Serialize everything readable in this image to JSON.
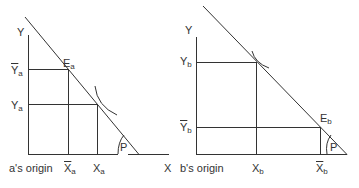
{
  "panel_a": {
    "y_axis": "Y",
    "x_axis": "X",
    "origin": "a's origin",
    "endowment": {
      "main": "E",
      "sub": "a"
    },
    "y_bar": {
      "main": "Y",
      "sub": "a"
    },
    "y_opt": {
      "main": "Y",
      "sub": "a"
    },
    "x_bar": {
      "main": "X",
      "sub": "a"
    },
    "x_opt": {
      "main": "X",
      "sub": "a"
    },
    "angle": "P"
  },
  "panel_b": {
    "y_axis": "Y",
    "origin": "b's origin",
    "endowment": {
      "main": "E",
      "sub": "b"
    },
    "y_opt": {
      "main": "Y",
      "sub": "b"
    },
    "y_bar": {
      "main": "Y",
      "sub": "b"
    },
    "x_opt": {
      "main": "X",
      "sub": "b"
    },
    "x_bar": {
      "main": "X",
      "sub": "b"
    },
    "angle": "P"
  },
  "colors": {
    "line": "#333333",
    "background": "#ffffff"
  }
}
